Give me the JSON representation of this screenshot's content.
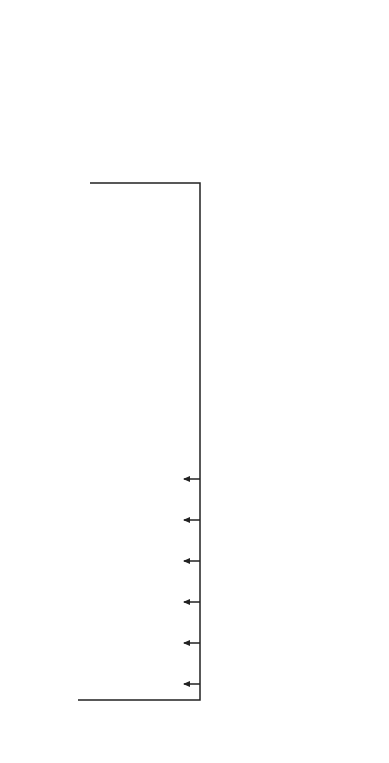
{
  "segments": {
    "heading": "Prioritized (Segmented) Customers",
    "items": [
      {
        "line1": "Erroneous",
        "line2": "Default"
      },
      {
        "line1": "Forgetful",
        "line2": ""
      },
      {
        "line1": "Chronically",
        "line2": "Late"
      },
      {
        "line1": "Short -Term",
        "line2": "Problems"
      },
      {
        "line1": "Customers",
        "line2": "in Crisis"
      },
      {
        "line1": "Likely",
        "line2": "Losses"
      }
    ]
  },
  "channels": {
    "heading": "Channels",
    "routing_label_1": "Intelligent",
    "routing_label_2": "Routing",
    "targeting_label_1": "Targeting",
    "targeting_label_2": "Engine",
    "direct_mail": "Direct Mail",
    "email": "E-Mail",
    "voice_blast": "Voice Blast",
    "live_rep": "Live Rep",
    "skilled_collector": "Highly Skilled Collector"
  },
  "interaction_history_1": "Interaction and",
  "interaction_history_2": "Contact History",
  "treatments": {
    "heading_1": "Differentiated",
    "heading_2": "Treatments",
    "items": [
      "Timing Options",
      "Contact Frequencies",
      "Channel Combinations",
      "Phone Numbers",
      "Messages",
      "Tones",
      "Remedies"
    ]
  },
  "collections_data": {
    "title_1": "Collections",
    "title_2": "Data*",
    "items": [
      "Customer Profiles",
      "Contact History",
      "Portfolio Performance",
      "Market Data",
      "Investor Guidelines",
      "Constraints"
    ]
  },
  "analytics_engine": {
    "title_1": "Analytics",
    "title_2": "Engine*",
    "items": [
      "Data Management",
      "Reporting",
      "Modeling",
      "Optimization"
    ]
  },
  "colors": {
    "ellipse": "#6b6b6b",
    "icon_gray": "#b8b8b8",
    "person": "#111111",
    "line": "#222222",
    "cylinder": "#6e6e6e"
  }
}
